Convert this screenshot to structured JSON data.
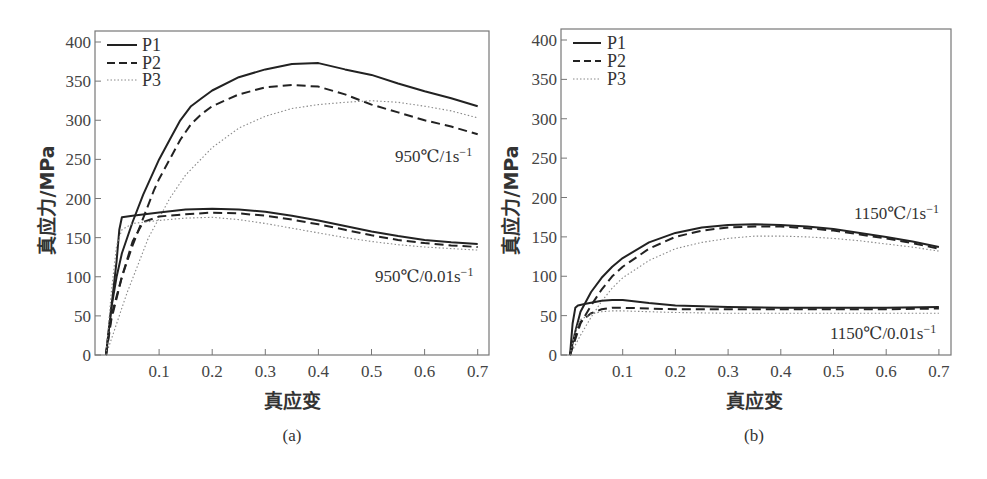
{
  "chart_data": [
    {
      "id": "a",
      "type": "line",
      "caption": "(a)",
      "xlabel": "真应变",
      "ylabel": "真应力/MPa",
      "xlim": [
        0,
        0.7
      ],
      "ylim": [
        0,
        400
      ],
      "xticks": [
        "0.1",
        "0.2",
        "0.3",
        "0.4",
        "0.5",
        "0.6",
        "0.7"
      ],
      "yticks": [
        "0",
        "50",
        "100",
        "150",
        "200",
        "250",
        "300",
        "350",
        "400"
      ],
      "grid": false,
      "legend": {
        "position": "upper-left",
        "entries": [
          "P1",
          "P2",
          "P3"
        ]
      },
      "annotations": [
        "950℃/1s⁻¹",
        "950℃/0.01s⁻¹"
      ],
      "series": [
        {
          "name": "P1",
          "condition": "950℃/1s⁻¹",
          "style": "solid",
          "x": [
            0,
            0.01,
            0.02,
            0.03,
            0.05,
            0.07,
            0.09,
            0.1,
            0.12,
            0.14,
            0.16,
            0.18,
            0.2,
            0.25,
            0.3,
            0.35,
            0.4,
            0.45,
            0.5,
            0.55,
            0.6,
            0.65,
            0.7
          ],
          "y": [
            0,
            60,
            100,
            130,
            170,
            205,
            235,
            250,
            275,
            300,
            318,
            328,
            338,
            355,
            365,
            372,
            373,
            365,
            358,
            347,
            337,
            328,
            318
          ]
        },
        {
          "name": "P2",
          "condition": "950℃/1s⁻¹",
          "style": "dashed",
          "x": [
            0,
            0.01,
            0.03,
            0.05,
            0.07,
            0.09,
            0.1,
            0.12,
            0.14,
            0.16,
            0.18,
            0.2,
            0.25,
            0.3,
            0.35,
            0.4,
            0.45,
            0.5,
            0.55,
            0.6,
            0.65,
            0.7
          ],
          "y": [
            0,
            50,
            100,
            140,
            175,
            210,
            225,
            250,
            275,
            295,
            308,
            318,
            333,
            342,
            345,
            343,
            333,
            320,
            310,
            300,
            292,
            282
          ]
        },
        {
          "name": "P3",
          "condition": "950℃/1s⁻¹",
          "style": "dotted",
          "x": [
            0,
            0.02,
            0.04,
            0.06,
            0.08,
            0.1,
            0.12,
            0.15,
            0.2,
            0.25,
            0.3,
            0.35,
            0.4,
            0.45,
            0.5,
            0.55,
            0.6,
            0.65,
            0.7
          ],
          "y": [
            0,
            40,
            80,
            115,
            150,
            175,
            200,
            230,
            265,
            290,
            305,
            315,
            320,
            323,
            325,
            323,
            318,
            312,
            303
          ]
        },
        {
          "name": "P1",
          "condition": "950℃/0.01s⁻¹",
          "style": "solid",
          "x": [
            0,
            0.01,
            0.02,
            0.025,
            0.03,
            0.05,
            0.1,
            0.15,
            0.2,
            0.25,
            0.3,
            0.35,
            0.4,
            0.45,
            0.5,
            0.55,
            0.6,
            0.65,
            0.7
          ],
          "y": [
            0,
            60,
            120,
            160,
            176,
            178,
            182,
            186,
            187,
            186,
            183,
            178,
            172,
            165,
            158,
            152,
            147,
            144,
            142
          ]
        },
        {
          "name": "P2",
          "condition": "950℃/0.01s⁻¹",
          "style": "dashed",
          "x": [
            0,
            0.01,
            0.03,
            0.05,
            0.07,
            0.1,
            0.15,
            0.2,
            0.25,
            0.3,
            0.35,
            0.4,
            0.45,
            0.5,
            0.55,
            0.6,
            0.65,
            0.7
          ],
          "y": [
            0,
            45,
            100,
            145,
            170,
            177,
            180,
            182,
            181,
            178,
            173,
            167,
            160,
            153,
            147,
            143,
            140,
            138
          ]
        },
        {
          "name": "P3",
          "condition": "950℃/0.01s⁻¹",
          "style": "dotted",
          "x": [
            0,
            0.01,
            0.02,
            0.03,
            0.05,
            0.1,
            0.15,
            0.2,
            0.25,
            0.3,
            0.35,
            0.4,
            0.45,
            0.5,
            0.55,
            0.6,
            0.65,
            0.7
          ],
          "y": [
            0,
            80,
            140,
            160,
            168,
            172,
            175,
            176,
            173,
            168,
            162,
            156,
            150,
            145,
            141,
            138,
            136,
            134
          ]
        }
      ]
    },
    {
      "id": "b",
      "type": "line",
      "caption": "(b)",
      "xlabel": "真应变",
      "ylabel": "真应力/MPa",
      "xlim": [
        0,
        0.7
      ],
      "ylim": [
        0,
        400
      ],
      "xticks": [
        "0.1",
        "0.2",
        "0.3",
        "0.4",
        "0.5",
        "0.6",
        "0.7"
      ],
      "yticks": [
        "0",
        "50",
        "100",
        "150",
        "200",
        "250",
        "300",
        "350",
        "400"
      ],
      "grid": false,
      "legend": {
        "position": "upper-left",
        "entries": [
          "P1",
          "P2",
          "P3"
        ]
      },
      "annotations": [
        "1150℃/1s⁻¹",
        "1150℃/0.01s⁻¹"
      ],
      "series": [
        {
          "name": "P1",
          "condition": "1150℃/1s⁻¹",
          "style": "solid",
          "x": [
            0,
            0.01,
            0.02,
            0.04,
            0.06,
            0.08,
            0.1,
            0.15,
            0.2,
            0.25,
            0.3,
            0.35,
            0.4,
            0.45,
            0.5,
            0.55,
            0.6,
            0.65,
            0.7
          ],
          "y": [
            0,
            30,
            55,
            80,
            98,
            112,
            123,
            143,
            155,
            162,
            165,
            166,
            165,
            163,
            160,
            155,
            150,
            144,
            137
          ]
        },
        {
          "name": "P2",
          "condition": "1150℃/1s⁻¹",
          "style": "dashed",
          "x": [
            0,
            0.01,
            0.02,
            0.04,
            0.06,
            0.08,
            0.1,
            0.15,
            0.2,
            0.25,
            0.3,
            0.35,
            0.4,
            0.45,
            0.5,
            0.55,
            0.6,
            0.65,
            0.7
          ],
          "y": [
            0,
            20,
            40,
            63,
            83,
            100,
            112,
            135,
            150,
            158,
            162,
            163,
            163,
            161,
            158,
            153,
            148,
            142,
            135
          ]
        },
        {
          "name": "P3",
          "condition": "1150℃/1s⁻¹",
          "style": "dotted",
          "x": [
            0,
            0.02,
            0.04,
            0.06,
            0.08,
            0.1,
            0.15,
            0.2,
            0.25,
            0.3,
            0.35,
            0.4,
            0.45,
            0.5,
            0.55,
            0.6,
            0.65,
            0.7
          ],
          "y": [
            0,
            25,
            48,
            68,
            85,
            98,
            120,
            135,
            143,
            148,
            151,
            151,
            150,
            148,
            145,
            141,
            137,
            132
          ]
        },
        {
          "name": "P1",
          "condition": "1150℃/0.01s⁻¹",
          "style": "solid",
          "x": [
            0,
            0.005,
            0.01,
            0.015,
            0.03,
            0.06,
            0.08,
            0.1,
            0.15,
            0.2,
            0.3,
            0.4,
            0.5,
            0.6,
            0.7
          ],
          "y": [
            0,
            40,
            60,
            63,
            65,
            69,
            70,
            70,
            66,
            63,
            61,
            60,
            60,
            60,
            61
          ]
        },
        {
          "name": "P2",
          "condition": "1150℃/0.01s⁻¹",
          "style": "dashed",
          "x": [
            0,
            0.01,
            0.02,
            0.04,
            0.06,
            0.08,
            0.1,
            0.15,
            0.2,
            0.3,
            0.4,
            0.5,
            0.6,
            0.7
          ],
          "y": [
            0,
            25,
            42,
            53,
            58,
            60,
            60,
            59,
            58,
            58,
            58,
            58,
            58,
            59
          ]
        },
        {
          "name": "P3",
          "condition": "1150℃/0.01s⁻¹",
          "style": "dotted",
          "x": [
            0,
            0.01,
            0.02,
            0.04,
            0.06,
            0.08,
            0.1,
            0.15,
            0.2,
            0.3,
            0.4,
            0.5,
            0.6,
            0.7
          ],
          "y": [
            0,
            30,
            45,
            52,
            55,
            56,
            56,
            55,
            54,
            53,
            53,
            53,
            53,
            53
          ]
        }
      ]
    }
  ],
  "charts": {
    "a": {
      "caption": "(a)",
      "xlabel": "真应变",
      "ylabel": "真应力/MPa",
      "legend": [
        "P1",
        "P2",
        "P3"
      ],
      "annot_high": "950℃/1s",
      "annot_low": "950℃/0.01s",
      "annot_exp": "−1"
    },
    "b": {
      "caption": "(b)",
      "xlabel": "真应变",
      "ylabel": "真应力/MPa",
      "legend": [
        "P1",
        "P2",
        "P3"
      ],
      "annot_high": "1150℃/1s",
      "annot_low": "1150℃/0.01s",
      "annot_exp": "−1"
    }
  }
}
